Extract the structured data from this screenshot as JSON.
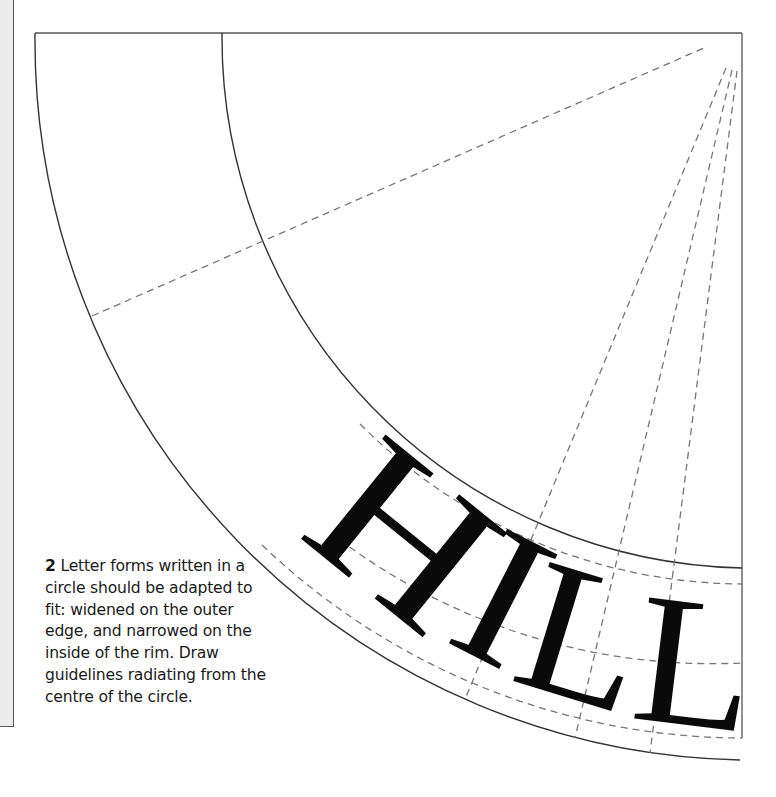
{
  "figure": {
    "number": "2",
    "caption": "Letter forms written in a circle should be adapted to fit: widened on the outer edge, and narrowed on the inside of the rim. Draw guidelines radiating from the centre of the circle.",
    "caption_lines": [
      "Letter forms written in a",
      "circle should be adapted to",
      "fit: widened on the outer",
      "edge, and narrowed on the",
      "inside of the rim. Draw",
      "guidelines radiating from the",
      "centre of the circle."
    ]
  },
  "lettering": {
    "word": "HILL",
    "letters": [
      {
        "char": "H",
        "x": 362,
        "y": 588,
        "rotate": 39
      },
      {
        "char": "I",
        "x": 474,
        "y": 656,
        "rotate": 27
      },
      {
        "char": "L",
        "x": 566,
        "y": 697,
        "rotate": 17
      },
      {
        "char": "L",
        "x": 688,
        "y": 725,
        "rotate": 7
      }
    ]
  },
  "geometry": {
    "center": [
      755,
      40
    ],
    "outer_radius": 720,
    "inner_radius": 531,
    "cap_guide_radius": 544,
    "mid_guide_radius": 623,
    "base_guide_radius": 698
  },
  "colors": {
    "line": "#333333",
    "dash": "#777777",
    "ink": "#0a0a0a",
    "strip": "#ececec"
  }
}
